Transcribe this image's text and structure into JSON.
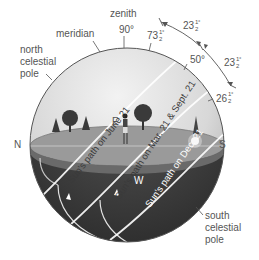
{
  "labels": {
    "zenith": "zenith",
    "meridian": "meridian",
    "north_celestial_pole": [
      "north",
      "celestial",
      "pole"
    ],
    "south_celestial_pole": [
      "south",
      "celestial",
      "pole"
    ],
    "north": "N",
    "south": "S",
    "east": "E",
    "west": "W"
  },
  "angles": {
    "zenith_angle": "90°",
    "june_altitude": "73",
    "equinox_altitude": "50°",
    "december_altitude": "26",
    "tilt_upper": "23",
    "tilt_lower": "23",
    "half": "1",
    "half_den": "2",
    "degree": "°"
  },
  "sun_paths": {
    "june": "Sun's path on June 21",
    "equinox": "Sun's path on Mar. 21 & Sept. 21",
    "december": "Sun's path on Dec. 21"
  },
  "colors": {
    "sky_light": "#e6e6e6",
    "sky_dark": "#bdbdbd",
    "ground": "#8f8f8f",
    "ground_top": "#a8a8a8",
    "below_horizon": "#3d3d3d",
    "path_line": "#ffffff",
    "outline": "#555555"
  }
}
